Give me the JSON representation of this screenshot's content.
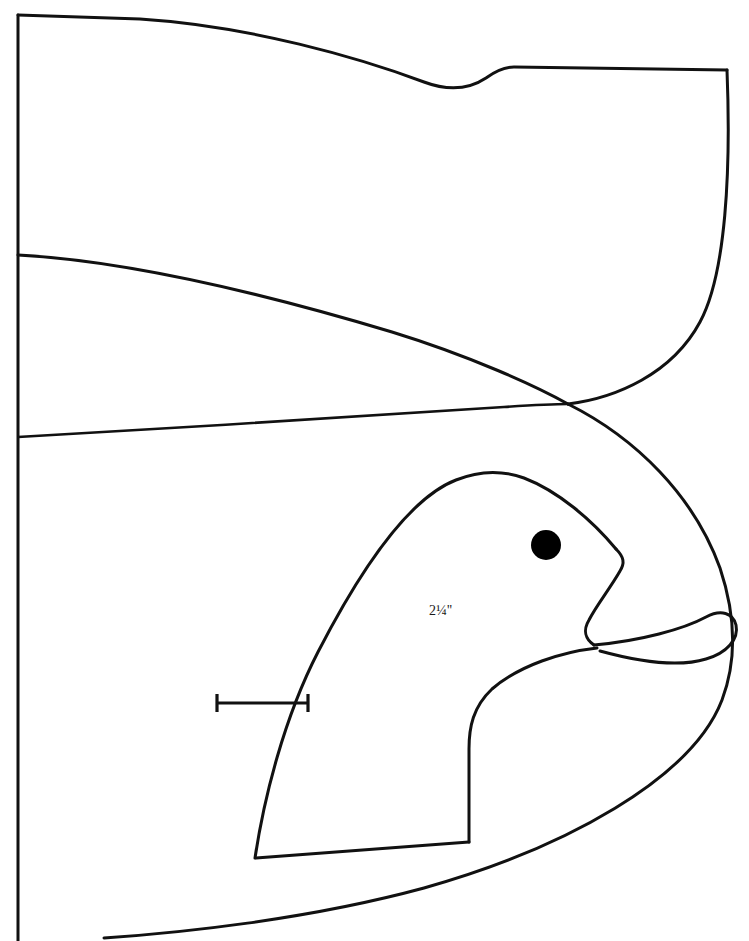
{
  "canvas": {
    "width": 749,
    "height": 941,
    "background": "#ffffff",
    "ink": "#111111"
  },
  "diagram": {
    "annotations": {
      "width_dimension": "2¼''"
    },
    "scale_bar": {
      "label": "2¼''",
      "x_start": 216,
      "x_end": 308,
      "y": 703,
      "cap_height": 18
    },
    "eye": {
      "cx": 546,
      "cy": 545,
      "r": 15,
      "color": "#000000"
    },
    "paths": {
      "top_body_edge": "M 18 15 L 140 19 C 260 28 370 62 430 84 C 452 92 470 90 487 78 C 497 71 505 68 512 68 L 727 70",
      "right_body_edge": "M 727 70 C 729 180 722 280 690 330 C 660 378 610 398 568 404",
      "wing_upper_curve": "M 18 255 C 150 262 300 300 420 340 C 480 361 532 387 568 404",
      "wing_lower_line": "M 18 437 C 160 429 360 416 500 408 C 530 406 553 405 568 404",
      "outer_body_lower": "M 568 404 C 640 440 700 500 726 580 C 740 626 738 668 722 706 C 690 782 560 850 420 890 C 300 922 180 934 104 938",
      "head_outline": "M 255 858 C 262 800 282 720 316 654 C 350 588 400 502 452 480 C 474 471 500 470 522 478 C 556 490 590 520 614 548",
      "beak_upper": "M 614 548 C 622 556 624 562 620 570 C 612 586 596 606 588 620 C 582 630 584 638 592 644",
      "beak_lower_tip": "M 592 644 C 640 640 684 628 706 616 C 722 608 734 612 736 624 C 738 638 728 652 706 658 C 680 666 640 662 600 650",
      "beak_inner_gape": "M 592 644 C 560 650 520 664 492 688 C 472 706 468 726 468 748 L 468 842",
      "neck_lower": "M 468 842 L 255 858",
      "left_spine": "M 18 15 L 18 941"
    }
  }
}
